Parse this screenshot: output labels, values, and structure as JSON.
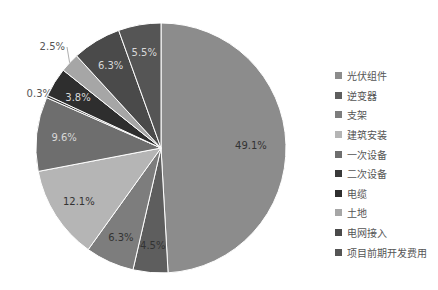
{
  "chart_data": {
    "type": "pie",
    "title": "",
    "categories": [
      "光伏组件",
      "逆变器",
      "支架",
      "建筑安装",
      "一次设备",
      "二次设备",
      "电缆",
      "土地",
      "电网接入",
      "项目前期开发费用"
    ],
    "values": [
      49.1,
      4.5,
      6.3,
      12.1,
      9.6,
      0.3,
      3.8,
      2.5,
      6.3,
      5.5
    ],
    "labels": [
      "49.1%",
      "4.5%",
      "6.3%",
      "12.1%",
      "9.6%",
      "0.3%",
      "3.8%",
      "2.5%",
      "6.3%",
      "5.5%"
    ],
    "colors": [
      "#8c8c8c",
      "#5e5e5e",
      "#7d7d7d",
      "#b5b5b5",
      "#6e6e6e",
      "#3a3a3a",
      "#2e2e2e",
      "#a6a6a6",
      "#4a4a4a",
      "#555555"
    ],
    "start_angle": "top, clockwise",
    "legend_position": "right"
  },
  "legend": {
    "items": [
      "光伏组件",
      "逆变器",
      "支架",
      "建筑安装",
      "一次设备",
      "二次设备",
      "电缆",
      "土地",
      "电网接入",
      "项目前期开发费用"
    ]
  }
}
